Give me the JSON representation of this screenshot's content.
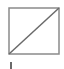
{
  "swatch": {
    "icon": "no-fill-icon",
    "label": "No fill",
    "stroke_color": "#8a8a8a",
    "diagonal_color": "#6a6a6a"
  },
  "cursor": {
    "icon": "text-caret-icon"
  }
}
